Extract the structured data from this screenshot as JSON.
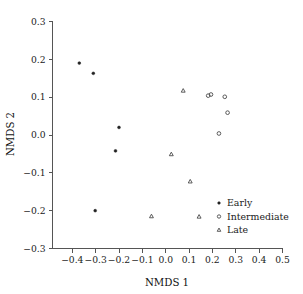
{
  "chart_data": {
    "type": "scatter",
    "title": "",
    "xlabel": "NMDS 1",
    "ylabel": "NMDS 2",
    "xlim": [
      -0.4,
      0.5
    ],
    "ylim": [
      -0.3,
      0.3
    ],
    "xticks": [
      -0.4,
      -0.3,
      -0.2,
      -0.1,
      0.0,
      0.1,
      0.2,
      0.3,
      0.4,
      0.5
    ],
    "xticklabels": [
      "−0.4",
      "−0.3",
      "−0.2",
      "−0.1",
      "0.0",
      "0.1",
      "0.2",
      "0.3",
      "0.4",
      "0.5"
    ],
    "yticks": [
      -0.3,
      -0.2,
      -0.1,
      0.0,
      0.1,
      0.2,
      0.3
    ],
    "yticklabels": [
      "−0.3",
      "−0.2",
      "−0.1",
      "0.0",
      "0.1",
      "0.2",
      "0.3"
    ],
    "grid": false,
    "legend_position": "bottom-right",
    "series": [
      {
        "name": "Early",
        "marker": "filled-circle",
        "color": "#222222",
        "points": [
          {
            "x": -0.37,
            "y": 0.19
          },
          {
            "x": -0.31,
            "y": 0.163
          },
          {
            "x": -0.2,
            "y": 0.02
          },
          {
            "x": -0.215,
            "y": -0.042
          },
          {
            "x": -0.302,
            "y": -0.2
          }
        ]
      },
      {
        "name": "Intermediate",
        "marker": "open-circle",
        "color": "#4a4a4a",
        "points": [
          {
            "x": 0.182,
            "y": 0.104
          },
          {
            "x": 0.194,
            "y": 0.107
          },
          {
            "x": 0.253,
            "y": 0.101
          },
          {
            "x": 0.265,
            "y": 0.059
          },
          {
            "x": 0.228,
            "y": 0.004
          }
        ]
      },
      {
        "name": "Late",
        "marker": "open-triangle",
        "color": "#4a4a4a",
        "points": [
          {
            "x": 0.075,
            "y": 0.117
          },
          {
            "x": 0.024,
            "y": -0.051
          },
          {
            "x": 0.105,
            "y": -0.123
          },
          {
            "x": -0.061,
            "y": -0.215
          },
          {
            "x": 0.143,
            "y": -0.216
          }
        ]
      }
    ],
    "legend": [
      {
        "label": "Early",
        "marker": "filled-circle"
      },
      {
        "label": "Intermediate",
        "marker": "open-circle"
      },
      {
        "label": "Late",
        "marker": "open-triangle"
      }
    ]
  }
}
